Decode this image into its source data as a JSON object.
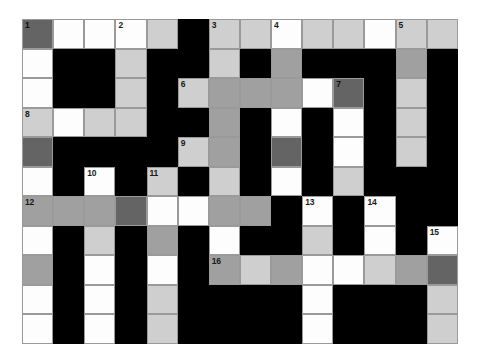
{
  "puzzle": {
    "title": "Crossword Grid",
    "columns": 14,
    "rows": 11,
    "palette": {
      "black": "#000000",
      "white": "#fdfdfd",
      "light_gray": "#cfcfcf",
      "medium_gray": "#a0a0a0",
      "dark_gray": "#646464",
      "grid_line": "#9a9a9a",
      "page_background": "#ffffff"
    },
    "legend": {
      "black": "blocked-cell",
      "white": "open-cell",
      "light_gray": "shaded-cell-light",
      "medium_gray": "shaded-cell-medium",
      "dark_gray": "shaded-cell-dark"
    },
    "clue_numbers": [
      1,
      2,
      3,
      4,
      5,
      6,
      7,
      8,
      9,
      10,
      11,
      12,
      13,
      14,
      15,
      16
    ],
    "grid": [
      [
        {
          "fill": "dark",
          "number": "1"
        },
        {
          "fill": "white",
          "number": ""
        },
        {
          "fill": "white",
          "number": ""
        },
        {
          "fill": "white",
          "number": "2"
        },
        {
          "fill": "light",
          "number": ""
        },
        {
          "fill": "black",
          "number": ""
        },
        {
          "fill": "light",
          "number": "3"
        },
        {
          "fill": "light",
          "number": ""
        },
        {
          "fill": "white",
          "number": "4"
        },
        {
          "fill": "light",
          "number": ""
        },
        {
          "fill": "light",
          "number": ""
        },
        {
          "fill": "white",
          "number": ""
        },
        {
          "fill": "light",
          "number": "5"
        },
        {
          "fill": "light",
          "number": ""
        }
      ],
      [
        {
          "fill": "white",
          "number": ""
        },
        {
          "fill": "black",
          "number": ""
        },
        {
          "fill": "black",
          "number": ""
        },
        {
          "fill": "light",
          "number": ""
        },
        {
          "fill": "black",
          "number": ""
        },
        {
          "fill": "black",
          "number": ""
        },
        {
          "fill": "light",
          "number": ""
        },
        {
          "fill": "black",
          "number": ""
        },
        {
          "fill": "medium",
          "number": ""
        },
        {
          "fill": "black",
          "number": ""
        },
        {
          "fill": "black",
          "number": ""
        },
        {
          "fill": "black",
          "number": ""
        },
        {
          "fill": "medium",
          "number": ""
        },
        {
          "fill": "black",
          "number": ""
        }
      ],
      [
        {
          "fill": "white",
          "number": ""
        },
        {
          "fill": "black",
          "number": ""
        },
        {
          "fill": "black",
          "number": ""
        },
        {
          "fill": "light",
          "number": ""
        },
        {
          "fill": "black",
          "number": ""
        },
        {
          "fill": "light",
          "number": "6"
        },
        {
          "fill": "medium",
          "number": ""
        },
        {
          "fill": "medium",
          "number": ""
        },
        {
          "fill": "medium",
          "number": ""
        },
        {
          "fill": "white",
          "number": ""
        },
        {
          "fill": "dark",
          "number": "7"
        },
        {
          "fill": "black",
          "number": ""
        },
        {
          "fill": "light",
          "number": ""
        },
        {
          "fill": "black",
          "number": ""
        }
      ],
      [
        {
          "fill": "light",
          "number": "8"
        },
        {
          "fill": "white",
          "number": ""
        },
        {
          "fill": "light",
          "number": ""
        },
        {
          "fill": "light",
          "number": ""
        },
        {
          "fill": "black",
          "number": ""
        },
        {
          "fill": "black",
          "number": ""
        },
        {
          "fill": "medium",
          "number": ""
        },
        {
          "fill": "black",
          "number": ""
        },
        {
          "fill": "white",
          "number": ""
        },
        {
          "fill": "black",
          "number": ""
        },
        {
          "fill": "white",
          "number": ""
        },
        {
          "fill": "black",
          "number": ""
        },
        {
          "fill": "light",
          "number": ""
        },
        {
          "fill": "black",
          "number": ""
        }
      ],
      [
        {
          "fill": "dark",
          "number": ""
        },
        {
          "fill": "black",
          "number": ""
        },
        {
          "fill": "black",
          "number": ""
        },
        {
          "fill": "black",
          "number": ""
        },
        {
          "fill": "black",
          "number": ""
        },
        {
          "fill": "light",
          "number": "9"
        },
        {
          "fill": "medium",
          "number": ""
        },
        {
          "fill": "black",
          "number": ""
        },
        {
          "fill": "dark",
          "number": ""
        },
        {
          "fill": "black",
          "number": ""
        },
        {
          "fill": "white",
          "number": ""
        },
        {
          "fill": "black",
          "number": ""
        },
        {
          "fill": "light",
          "number": ""
        },
        {
          "fill": "black",
          "number": ""
        }
      ],
      [
        {
          "fill": "white",
          "number": ""
        },
        {
          "fill": "black",
          "number": ""
        },
        {
          "fill": "white",
          "number": "10"
        },
        {
          "fill": "black",
          "number": ""
        },
        {
          "fill": "light",
          "number": "11"
        },
        {
          "fill": "black",
          "number": ""
        },
        {
          "fill": "light",
          "number": ""
        },
        {
          "fill": "black",
          "number": ""
        },
        {
          "fill": "white",
          "number": ""
        },
        {
          "fill": "black",
          "number": ""
        },
        {
          "fill": "light",
          "number": ""
        },
        {
          "fill": "black",
          "number": ""
        },
        {
          "fill": "black",
          "number": ""
        },
        {
          "fill": "black",
          "number": ""
        }
      ],
      [
        {
          "fill": "medium",
          "number": "12"
        },
        {
          "fill": "medium",
          "number": ""
        },
        {
          "fill": "medium",
          "number": ""
        },
        {
          "fill": "dark",
          "number": ""
        },
        {
          "fill": "white",
          "number": ""
        },
        {
          "fill": "white",
          "number": ""
        },
        {
          "fill": "medium",
          "number": ""
        },
        {
          "fill": "medium",
          "number": ""
        },
        {
          "fill": "black",
          "number": ""
        },
        {
          "fill": "white",
          "number": "13"
        },
        {
          "fill": "black",
          "number": ""
        },
        {
          "fill": "white",
          "number": "14"
        },
        {
          "fill": "black",
          "number": ""
        },
        {
          "fill": "black",
          "number": ""
        }
      ],
      [
        {
          "fill": "white",
          "number": ""
        },
        {
          "fill": "black",
          "number": ""
        },
        {
          "fill": "light",
          "number": ""
        },
        {
          "fill": "black",
          "number": ""
        },
        {
          "fill": "medium",
          "number": ""
        },
        {
          "fill": "black",
          "number": ""
        },
        {
          "fill": "white",
          "number": ""
        },
        {
          "fill": "black",
          "number": ""
        },
        {
          "fill": "black",
          "number": ""
        },
        {
          "fill": "light",
          "number": ""
        },
        {
          "fill": "black",
          "number": ""
        },
        {
          "fill": "white",
          "number": ""
        },
        {
          "fill": "black",
          "number": ""
        },
        {
          "fill": "white",
          "number": "15"
        }
      ],
      [
        {
          "fill": "medium",
          "number": ""
        },
        {
          "fill": "black",
          "number": ""
        },
        {
          "fill": "white",
          "number": ""
        },
        {
          "fill": "black",
          "number": ""
        },
        {
          "fill": "white",
          "number": ""
        },
        {
          "fill": "black",
          "number": ""
        },
        {
          "fill": "medium",
          "number": "16"
        },
        {
          "fill": "light",
          "number": ""
        },
        {
          "fill": "medium",
          "number": ""
        },
        {
          "fill": "white",
          "number": ""
        },
        {
          "fill": "white",
          "number": ""
        },
        {
          "fill": "light",
          "number": ""
        },
        {
          "fill": "medium",
          "number": ""
        },
        {
          "fill": "dark",
          "number": ""
        }
      ],
      [
        {
          "fill": "white",
          "number": ""
        },
        {
          "fill": "black",
          "number": ""
        },
        {
          "fill": "white",
          "number": ""
        },
        {
          "fill": "black",
          "number": ""
        },
        {
          "fill": "light",
          "number": ""
        },
        {
          "fill": "black",
          "number": ""
        },
        {
          "fill": "black",
          "number": ""
        },
        {
          "fill": "black",
          "number": ""
        },
        {
          "fill": "black",
          "number": ""
        },
        {
          "fill": "white",
          "number": ""
        },
        {
          "fill": "black",
          "number": ""
        },
        {
          "fill": "black",
          "number": ""
        },
        {
          "fill": "black",
          "number": ""
        },
        {
          "fill": "light",
          "number": ""
        }
      ],
      [
        {
          "fill": "white",
          "number": ""
        },
        {
          "fill": "black",
          "number": ""
        },
        {
          "fill": "white",
          "number": ""
        },
        {
          "fill": "black",
          "number": ""
        },
        {
          "fill": "light",
          "number": ""
        },
        {
          "fill": "black",
          "number": ""
        },
        {
          "fill": "black",
          "number": ""
        },
        {
          "fill": "black",
          "number": ""
        },
        {
          "fill": "black",
          "number": ""
        },
        {
          "fill": "white",
          "number": ""
        },
        {
          "fill": "black",
          "number": ""
        },
        {
          "fill": "black",
          "number": ""
        },
        {
          "fill": "black",
          "number": ""
        },
        {
          "fill": "light",
          "number": ""
        }
      ]
    ]
  }
}
